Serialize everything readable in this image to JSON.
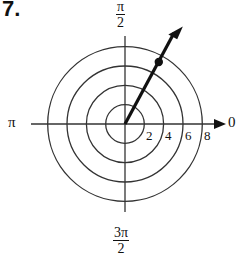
{
  "figure": {
    "problem_number": "7.",
    "type": "polar-grid",
    "angle_labels": {
      "right": "0",
      "top": {
        "numerator": "π",
        "denominator": "2"
      },
      "left": "π",
      "bottom": {
        "numerator": "3π",
        "denominator": "2"
      }
    },
    "ring_labels": [
      "2",
      "4",
      "6",
      "8"
    ],
    "rings": [
      2,
      4,
      6,
      8
    ],
    "point": {
      "r": 7,
      "theta_deg": 60,
      "label": ""
    },
    "ray": {
      "theta_deg": 60,
      "direction": "outward-arrow"
    },
    "colors": {
      "ink": "#111111",
      "grid": "#333333",
      "background": "#ffffff"
    }
  }
}
